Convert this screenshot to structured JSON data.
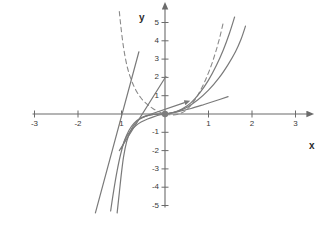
{
  "figure": {
    "background_color": "#ffffff",
    "axis_color": "#6b6b6b",
    "curve_color": "#7a7a7a",
    "dashed_color": "#8a8a8a",
    "point_color": "#7d7d7d",
    "label_color": "#3a3a3a"
  },
  "axes": {
    "x_label": "x",
    "y_label": "y",
    "origin_px": {
      "x": 165,
      "y": 114
    },
    "unit_px": {
      "x": 43.5,
      "y": 18.3
    },
    "xlim": [
      -3,
      3
    ],
    "ylim": [
      -5,
      5
    ],
    "x_ticks": [
      -3,
      -2,
      -1,
      1,
      2,
      3
    ],
    "y_ticks": [
      -5,
      -4,
      -3,
      -2,
      -1,
      1,
      2,
      3,
      4,
      5
    ],
    "x_tick_labels": [
      "-3",
      "-2",
      "1",
      "1",
      "2",
      "3"
    ],
    "y_tick_labels": [
      "5",
      "4",
      "3",
      "2",
      "1",
      "-1",
      "-2",
      "-3",
      "-4",
      "-5"
    ],
    "x_arrow": "right",
    "y_arrow": "up",
    "grid": false
  },
  "chart_data": {
    "type": "line",
    "title": "",
    "xlabel": "x",
    "ylabel": "y",
    "xlim": [
      -3,
      3
    ],
    "ylim": [
      -5,
      5
    ],
    "grid": false,
    "legend": "none",
    "annotations": [
      {
        "name": "origin-point",
        "x": 0,
        "y": 0,
        "marker": "filled-circle"
      }
    ],
    "series": [
      {
        "name": "dashed-steep-log-curve",
        "style": "dashed",
        "color": "#8a8a8a",
        "points": [
          [
            -1.05,
            5.6
          ],
          [
            -1.02,
            4.9
          ],
          [
            -0.98,
            4.1
          ],
          [
            -0.93,
            3.3
          ],
          [
            -0.86,
            2.5
          ],
          [
            -0.78,
            1.9
          ],
          [
            -0.68,
            1.35
          ],
          [
            -0.56,
            0.9
          ],
          [
            -0.42,
            0.55
          ],
          [
            -0.28,
            0.3
          ],
          [
            -0.14,
            0.12
          ],
          [
            0.0,
            0.0
          ],
          [
            0.18,
            -0.05
          ],
          [
            0.34,
            0.02
          ],
          [
            0.48,
            0.2
          ],
          [
            0.62,
            0.55
          ],
          [
            0.76,
            1.05
          ],
          [
            0.9,
            1.7
          ],
          [
            1.04,
            2.5
          ],
          [
            1.16,
            3.35
          ],
          [
            1.26,
            4.2
          ],
          [
            1.35,
            5.1
          ]
        ]
      },
      {
        "name": "solid-steep-curve-a",
        "style": "solid",
        "color": "#7a7a7a",
        "points": [
          [
            -1.1,
            -5.4
          ],
          [
            -1.05,
            -4.3
          ],
          [
            -1.0,
            -3.2
          ],
          [
            -0.95,
            -2.3
          ],
          [
            -0.88,
            -1.5
          ],
          [
            -0.8,
            -0.95
          ],
          [
            -0.7,
            -0.55
          ],
          [
            -0.58,
            -0.28
          ],
          [
            -0.44,
            -0.12
          ],
          [
            -0.3,
            -0.04
          ],
          [
            -0.15,
            0.0
          ],
          [
            0.0,
            0.0
          ],
          [
            0.2,
            0.08
          ],
          [
            0.4,
            0.28
          ],
          [
            0.6,
            0.62
          ],
          [
            0.8,
            1.15
          ],
          [
            1.0,
            1.85
          ],
          [
            1.18,
            2.65
          ],
          [
            1.34,
            3.5
          ],
          [
            1.48,
            4.4
          ],
          [
            1.6,
            5.3
          ]
        ]
      },
      {
        "name": "solid-steep-curve-b",
        "style": "solid",
        "color": "#7a7a7a",
        "points": [
          [
            -1.25,
            -5.3
          ],
          [
            -1.18,
            -4.2
          ],
          [
            -1.1,
            -3.1
          ],
          [
            -1.02,
            -2.2
          ],
          [
            -0.93,
            -1.45
          ],
          [
            -0.83,
            -0.9
          ],
          [
            -0.71,
            -0.5
          ],
          [
            -0.57,
            -0.24
          ],
          [
            -0.42,
            -0.1
          ],
          [
            -0.26,
            -0.02
          ],
          [
            -0.12,
            0.0
          ],
          [
            0.0,
            0.0
          ],
          [
            0.25,
            0.12
          ],
          [
            0.5,
            0.36
          ],
          [
            0.75,
            0.76
          ],
          [
            1.0,
            1.3
          ],
          [
            1.25,
            2.0
          ],
          [
            1.45,
            2.7
          ],
          [
            1.62,
            3.4
          ],
          [
            1.75,
            4.1
          ],
          [
            1.85,
            4.8
          ]
        ]
      },
      {
        "name": "solid-shallow-curve",
        "style": "solid",
        "color": "#7a7a7a",
        "points": [
          [
            -1.0,
            -1.9
          ],
          [
            -0.9,
            -1.3
          ],
          [
            -0.8,
            -0.95
          ],
          [
            -0.68,
            -0.66
          ],
          [
            -0.55,
            -0.44
          ],
          [
            -0.4,
            -0.27
          ],
          [
            -0.25,
            -0.14
          ],
          [
            -0.1,
            -0.04
          ],
          [
            0.0,
            0.0
          ],
          [
            0.3,
            0.13
          ],
          [
            0.6,
            0.3
          ],
          [
            0.9,
            0.52
          ],
          [
            1.2,
            0.75
          ],
          [
            1.45,
            0.95
          ]
        ]
      },
      {
        "name": "straight-line-steep",
        "style": "solid",
        "color": "#7a7a7a",
        "points": [
          [
            -1.6,
            -5.4
          ],
          [
            -0.6,
            3.4
          ]
        ]
      },
      {
        "name": "straight-line-through-origin",
        "style": "solid",
        "color": "#7a7a7a",
        "points": [
          [
            -1.05,
            -2.0
          ],
          [
            0.02,
            2.05
          ]
        ]
      },
      {
        "name": "short-arrow-segment",
        "style": "solid-arrow",
        "color": "#7a7a7a",
        "points": [
          [
            -0.5,
            -0.15
          ],
          [
            0.45,
            0.62
          ]
        ]
      }
    ]
  }
}
